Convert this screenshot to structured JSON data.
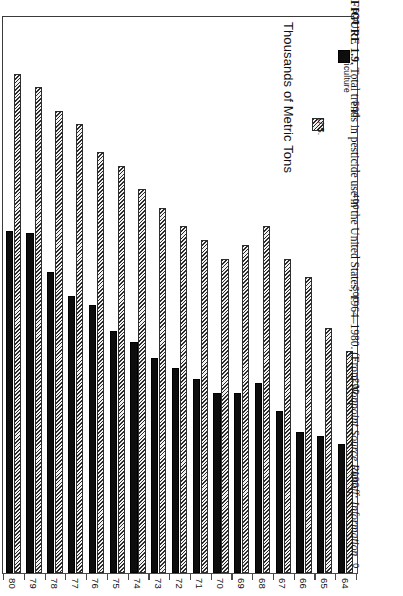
{
  "figure": {
    "number_label": "FIGURE 1.9.",
    "caption_text": "Total trends in pesticide use in the United States, 1964–1980. (From ",
    "source_italic": "Nonpoint Source Runoff: Information"
  },
  "legend": {
    "title": "Thousands of Metric Tons",
    "entries": [
      {
        "label": "U.S.",
        "swatch": "hatched-diagonal",
        "color": "#d9d9d9"
      },
      {
        "label": "Agriculture",
        "swatch": "solid-black",
        "color": "#0d0d0d"
      }
    ]
  },
  "axes": {
    "value_axis_title": "Thousands of Metric Tons",
    "value_ticks": [
      "0",
      "100",
      "200",
      "300",
      "400",
      "500",
      "600"
    ],
    "value_tick_values": [
      0,
      100,
      200,
      300,
      400,
      500,
      600
    ],
    "category_axis_title": "",
    "category_ticks": [
      "80",
      "79",
      "78",
      "77",
      "76",
      "75",
      "74",
      "73",
      "72",
      "71",
      "70",
      "69",
      "68",
      "67",
      "66",
      "65",
      "64"
    ]
  },
  "chart_data": {
    "type": "bar",
    "title": "Total trends in pesticide use in the United States, 1964–1980",
    "orientation": "vertical-bars-rotated-page",
    "xlabel": "",
    "ylabel": "Thousands of Metric Tons",
    "ylim": [
      0,
      600
    ],
    "grid": false,
    "legend_position": "right",
    "categories": [
      "80",
      "79",
      "78",
      "77",
      "76",
      "75",
      "74",
      "73",
      "72",
      "71",
      "70",
      "69",
      "68",
      "67",
      "66",
      "65",
      "64"
    ],
    "series": [
      {
        "name": "U.S.",
        "pattern": "hatched-diagonal",
        "values": [
          540,
          525,
          500,
          485,
          455,
          440,
          415,
          395,
          375,
          360,
          340,
          355,
          375,
          340,
          320,
          265,
          240
        ]
      },
      {
        "name": "Agriculture",
        "pattern": "solid-black",
        "values": [
          370,
          368,
          325,
          300,
          290,
          262,
          250,
          232,
          222,
          210,
          195,
          195,
          205,
          175,
          152,
          148,
          140
        ]
      }
    ]
  }
}
